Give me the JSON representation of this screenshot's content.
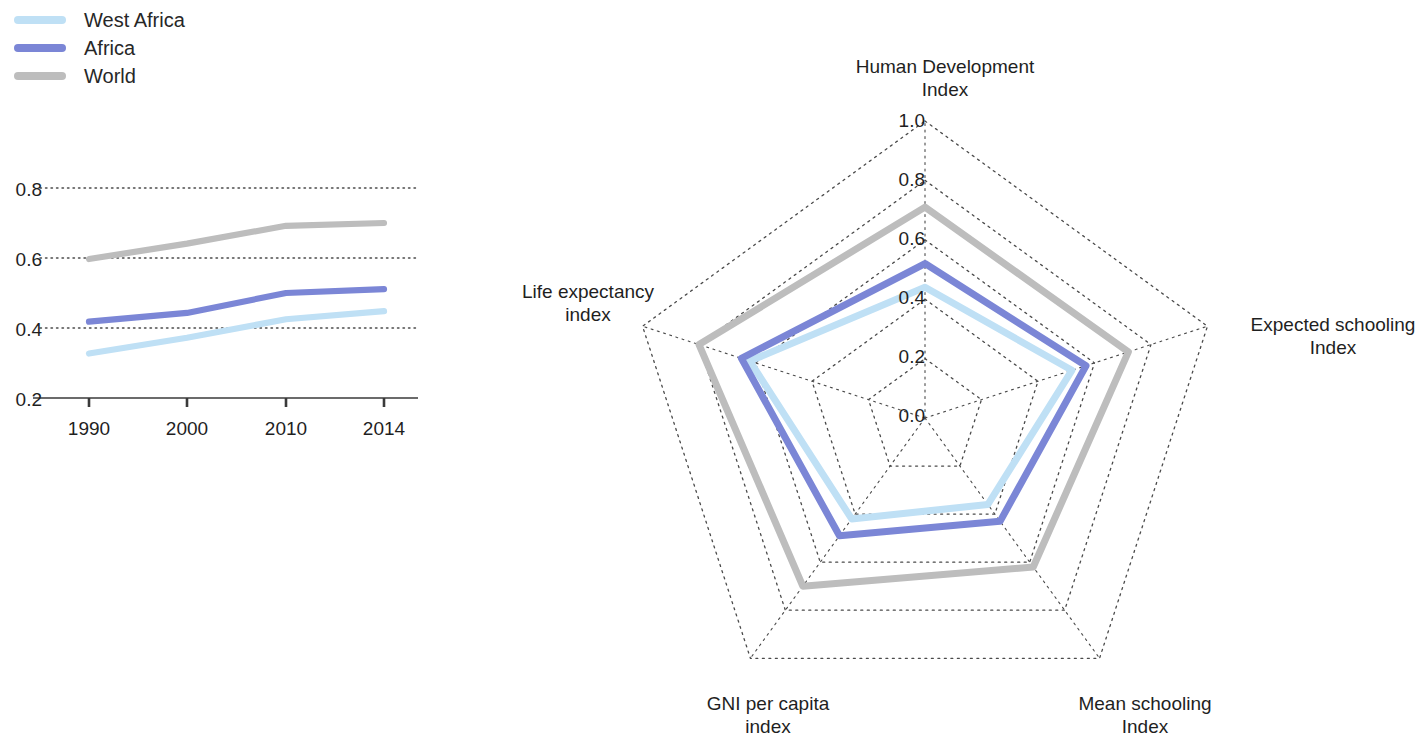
{
  "legend": {
    "items": [
      {
        "label": "West Africa",
        "color": "#bfe0f5",
        "swatch_name": "legend-swatch-west-africa"
      },
      {
        "label": "Africa",
        "color": "#7b86d6",
        "swatch_name": "legend-swatch-africa"
      },
      {
        "label": "World",
        "color": "#bdbdbd",
        "swatch_name": "legend-swatch-world"
      }
    ]
  },
  "chart_data": [
    {
      "type": "line",
      "title": "",
      "xlabel": "",
      "ylabel": "",
      "categories": [
        "1990",
        "2000",
        "2010",
        "2014"
      ],
      "x": [
        1990,
        2000,
        2010,
        2014
      ],
      "ylim": [
        0.2,
        0.8
      ],
      "yticks": [
        0.2,
        0.4,
        0.6,
        0.8
      ],
      "ytick_labels": [
        "0.2",
        "0.4",
        "0.6",
        "0.8"
      ],
      "grid": true,
      "grid_style": "dotted-horizontal",
      "legend_position": "top-left-external",
      "series": [
        {
          "name": "West Africa",
          "color": "#bfe0f5",
          "values": [
            0.327,
            0.372,
            0.425,
            0.448
          ]
        },
        {
          "name": "Africa",
          "color": "#7b86d6",
          "values": [
            0.418,
            0.443,
            0.5,
            0.511
          ]
        },
        {
          "name": "World",
          "color": "#bdbdbd",
          "values": [
            0.597,
            0.641,
            0.692,
            0.7
          ]
        }
      ]
    },
    {
      "type": "radar",
      "title": "",
      "axes": [
        "Human Development\nIndex",
        "Expected schooling\nIndex",
        "Mean schooling\nIndex",
        "GNI per capita\nindex",
        "Life expectancy\nindex"
      ],
      "rlim": [
        0.0,
        1.0
      ],
      "rticks": [
        0.0,
        0.2,
        0.4,
        0.6,
        0.8,
        1.0
      ],
      "rtick_labels": [
        "0.0",
        "0.2",
        "0.4",
        "0.6",
        "0.8",
        "1.0"
      ],
      "grid": true,
      "grid_style": "dotted-pentagon",
      "legend_position": "top-left-external",
      "series": [
        {
          "name": "West Africa",
          "color": "#bfe0f5",
          "values": [
            0.44,
            0.52,
            0.36,
            0.42,
            0.62
          ]
        },
        {
          "name": "Africa",
          "color": "#7b86d6",
          "values": [
            0.52,
            0.57,
            0.43,
            0.49,
            0.65
          ]
        },
        {
          "name": "World",
          "color": "#bdbdbd",
          "values": [
            0.71,
            0.72,
            0.62,
            0.7,
            0.8
          ]
        }
      ]
    }
  ],
  "line_chart_axis": {
    "ytick_labels": [
      "0.8",
      "0.6",
      "0.4",
      "0.2"
    ],
    "xtick_labels": [
      "1990",
      "2000",
      "2010",
      "2014"
    ]
  },
  "radar_axis": {
    "rtick_labels": [
      "1.0",
      "0.8",
      "0.6",
      "0.4",
      "0.2",
      "0.0"
    ],
    "label_top": "Human Development\nIndex",
    "label_right": "Expected schooling\nIndex",
    "label_bottom_right": "Mean schooling\nIndex",
    "label_bottom_left": "GNI per capita\nindex",
    "label_left": "Life expectancy\nindex"
  },
  "colors": {
    "west_africa": "#bfe0f5",
    "africa": "#7b86d6",
    "world": "#bdbdbd",
    "grid": "#4a4a4a",
    "axis": "#3a3a3a",
    "text": "#1f1f1f"
  }
}
